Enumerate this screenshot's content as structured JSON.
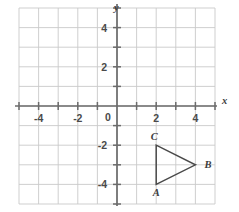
{
  "chart_data": {
    "type": "scatter",
    "title": "",
    "xlabel": "x",
    "ylabel": "y",
    "xlim": [
      -5.1,
      5.1
    ],
    "ylim": [
      -5.1,
      5.1
    ],
    "grid": true,
    "grid_step": 1,
    "legend": "none",
    "x_tick_labels": [
      "-4",
      "-2",
      "0",
      "2",
      "4"
    ],
    "x_tick_values": [
      -4,
      -2,
      0,
      2,
      4
    ],
    "y_tick_labels": [
      "4",
      "2",
      "-2",
      "-4"
    ],
    "y_tick_values": [
      4,
      2,
      -2,
      -4
    ],
    "origin_label": "0",
    "minor_tick_values_x": [
      -5,
      -3,
      -1,
      1,
      3,
      5
    ],
    "minor_tick_values_y": [
      -5,
      -3,
      -1,
      1,
      3,
      5
    ],
    "annotations": [
      {
        "label": "A",
        "x": 2,
        "y": -4,
        "label_dx": 0,
        "label_dy": 12,
        "anchor": "middle"
      },
      {
        "label": "B",
        "x": 4,
        "y": -3,
        "label_dx": 9,
        "label_dy": 3,
        "anchor": "start"
      },
      {
        "label": "C",
        "x": 2,
        "y": -2,
        "label_dx": -2,
        "label_dy": -5,
        "anchor": "middle"
      }
    ],
    "series": [
      {
        "name": "triangle-ABC",
        "type": "polygon",
        "closed": true,
        "points": [
          {
            "label": "A",
            "x": 2,
            "y": -4
          },
          {
            "label": "B",
            "x": 4,
            "y": -3
          },
          {
            "label": "C",
            "x": 2,
            "y": -2
          }
        ]
      }
    ]
  },
  "axes": {
    "x_axis_name": "x",
    "y_axis_name": "y"
  },
  "colors": {
    "grid": "#c9c9c9",
    "axis": "#6b6b6b",
    "shape": "#4a4a4a",
    "text": "#3c3c3c",
    "background": "#ffffff"
  }
}
